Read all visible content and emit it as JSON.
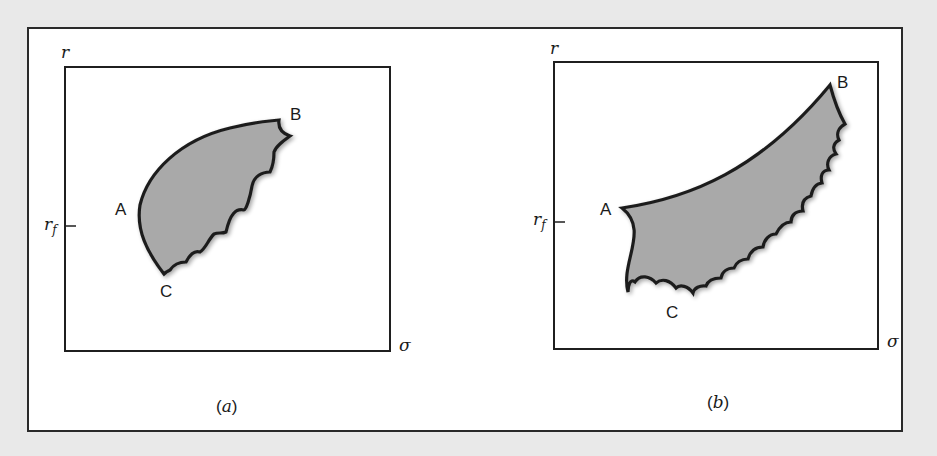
{
  "figure": {
    "panels": [
      {
        "id": "a",
        "caption": "(a)",
        "caption_letter": "a",
        "y_axis_label": "r",
        "x_axis_label": "σ",
        "tick_label": "r",
        "tick_subscript": "f",
        "points": {
          "A": "A",
          "B": "B",
          "C": "C"
        },
        "description": "Feasible set shaded; upper-left boundary smooth curve A–B, lower-right boundary scalloped B–C, left edge curve A–C"
      },
      {
        "id": "b",
        "caption": "(b)",
        "caption_letter": "b",
        "y_axis_label": "r",
        "x_axis_label": "σ",
        "tick_label": "r",
        "tick_subscript": "f",
        "points": {
          "A": "A",
          "B": "B",
          "C": "C"
        },
        "description": "Feasible set shaded; concave-up curve A–B, concave curve A–C, scalloped boundary C–B"
      }
    ],
    "colors": {
      "page_background": "#e9e9e9",
      "frame_background": "#ffffff",
      "outline": "#1f1f1f",
      "region_fill": "#a9a9a9"
    }
  }
}
